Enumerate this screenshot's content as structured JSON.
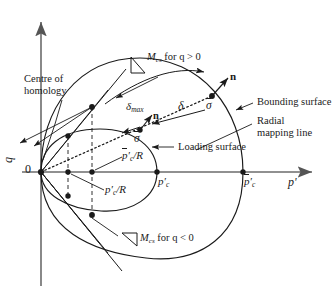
{
  "figure": {
    "type": "bounding-surface-plasticity-diagram"
  },
  "axes": {
    "x_label": "p'",
    "y_label": "q",
    "origin_label": "0",
    "x_axis_name": "mean-effective-stress-axis",
    "y_axis_name": "deviatoric-stress-axis"
  },
  "labels": {
    "mcs_positive": "M_cs for q > 0",
    "mcs_positive_base": "M",
    "mcs_positive_sub": "cs",
    "mcs_positive_cond": "for q > 0",
    "mcs_negative_base": "M",
    "mcs_negative_sub": "cs",
    "mcs_negative_cond": "for q < 0",
    "centre_of_homology_line1": "Centre of",
    "centre_of_homology_line2": "homology",
    "bounding_surface": "Bounding surface",
    "radial_mapping_line1": "Radial",
    "radial_mapping_line2": "mapping line",
    "loading_surface": "Loading surface",
    "delta_max_base": "δ",
    "delta_max_sub": "max",
    "delta": "δ",
    "sigma_bar": "σ",
    "sigma": "σ",
    "normal_bar": "n",
    "normal": "n",
    "pc_bar": "p",
    "pc_bar_sub": "c",
    "pc": "p",
    "pc_sub": "c",
    "pc_bar_over_R_base": "p",
    "pc_bar_over_R_sub": "c",
    "pc_bar_over_R_div": "/R",
    "pc_over_R_base": "p",
    "pc_over_R_sub": "c",
    "pc_over_R_div": "/R"
  },
  "colors": {
    "stroke": "#1a1a1a",
    "axis": "#6b6b6b",
    "background": "#ffffff",
    "text": "#1a1a1a"
  },
  "points": [
    {
      "name": "origin",
      "x": 41,
      "y": 172
    },
    {
      "name": "pc-over-R",
      "x": 68,
      "y": 172
    },
    {
      "name": "pc-bar-over-R",
      "x": 92,
      "y": 172
    },
    {
      "name": "pc-prime",
      "x": 157,
      "y": 172
    },
    {
      "name": "pc-bar-prime",
      "x": 243,
      "y": 172
    },
    {
      "name": "sigma-bar-point",
      "x": 212,
      "y": 96
    },
    {
      "name": "sigma-point",
      "x": 140,
      "y": 130
    },
    {
      "name": "mcs-upper-inner",
      "x": 68,
      "y": 136
    },
    {
      "name": "mcs-upper-outer",
      "x": 92,
      "y": 107
    },
    {
      "name": "mcs-lower-inner",
      "x": 68,
      "y": 196
    },
    {
      "name": "mcs-lower-outer",
      "x": 92,
      "y": 215
    }
  ]
}
